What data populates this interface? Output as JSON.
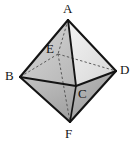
{
  "figure": {
    "name": "octahedron-diagram",
    "type": "3d-polyhedron",
    "shape": "octahedron",
    "background_color": "#ffffff",
    "stroke_color": "#141414",
    "hidden_edge_style": "dashed",
    "width": 138,
    "height": 142
  },
  "labels": {
    "a": "A",
    "b": "B",
    "c": "C",
    "d": "D",
    "e": "E",
    "f": "F"
  },
  "geometry": {
    "vertices": [
      {
        "id": "A",
        "label": "A",
        "x": 68,
        "y": 20,
        "role": "top-apex",
        "hidden": false
      },
      {
        "id": "B",
        "label": "B",
        "x": 20,
        "y": 77,
        "role": "left",
        "hidden": false
      },
      {
        "id": "C",
        "label": "C",
        "x": 76,
        "y": 86,
        "role": "front",
        "hidden": false
      },
      {
        "id": "D",
        "label": "D",
        "x": 116,
        "y": 71,
        "role": "right",
        "hidden": false
      },
      {
        "id": "E",
        "label": "E",
        "x": 58,
        "y": 54,
        "role": "back",
        "hidden": true
      },
      {
        "id": "F",
        "label": "F",
        "x": 70,
        "y": 122,
        "role": "bottom-apex",
        "hidden": false
      }
    ],
    "label_positions": [
      {
        "id": "A",
        "x": 63,
        "y": 2
      },
      {
        "id": "B",
        "x": 5,
        "y": 69
      },
      {
        "id": "C",
        "x": 78,
        "y": 87
      },
      {
        "id": "D",
        "x": 120,
        "y": 63
      },
      {
        "id": "E",
        "x": 46,
        "y": 42
      },
      {
        "id": "F",
        "x": 65,
        "y": 127
      }
    ],
    "visible_edges": [
      [
        "A",
        "B"
      ],
      [
        "A",
        "C"
      ],
      [
        "A",
        "D"
      ],
      [
        "B",
        "C"
      ],
      [
        "C",
        "D"
      ],
      [
        "B",
        "F"
      ],
      [
        "C",
        "F"
      ],
      [
        "D",
        "F"
      ]
    ],
    "hidden_edges": [
      [
        "A",
        "E"
      ],
      [
        "E",
        "B"
      ],
      [
        "E",
        "D"
      ],
      [
        "E",
        "F"
      ]
    ],
    "faces": [
      {
        "id": "ABC",
        "vertices": [
          "A",
          "B",
          "C"
        ],
        "fill": "#c9c9c9"
      },
      {
        "id": "ACD",
        "vertices": [
          "A",
          "C",
          "D"
        ],
        "fill": "#e3e3e3"
      },
      {
        "id": "BCF",
        "vertices": [
          "B",
          "C",
          "F"
        ],
        "fill": "#b4b4b4"
      },
      {
        "id": "CDF",
        "vertices": [
          "C",
          "D",
          "F"
        ],
        "fill": "#a0a0a0"
      },
      {
        "id": "ABE",
        "vertices": [
          "A",
          "B",
          "E"
        ],
        "fill": "#d4d4d4"
      },
      {
        "id": "ADE",
        "vertices": [
          "A",
          "D",
          "E"
        ],
        "fill": "#ededed"
      },
      {
        "id": "BEF",
        "vertices": [
          "B",
          "E",
          "F"
        ],
        "fill": "#cdcdcd"
      },
      {
        "id": "DEF",
        "vertices": [
          "D",
          "E",
          "F"
        ],
        "fill": "#d9d9d9"
      }
    ]
  },
  "colors": {
    "outline": "#141414",
    "hidden_line": "#4d4d4d",
    "light_face": "#ededed",
    "mid_face": "#c9c9c9",
    "dark_face": "#a0a0a0"
  }
}
